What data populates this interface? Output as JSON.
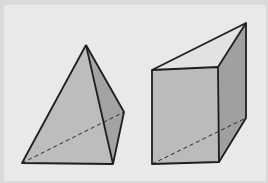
{
  "figure": {
    "background": "#e8e8e8",
    "face_light": "#b9b9b9",
    "face_dark": "#9e9e9e",
    "edge_color": "#1e1e1e",
    "shapes": [
      {
        "name": "tetrahedron",
        "vertices": {
          "apex": [
            86,
            45
          ],
          "right": [
            124,
            112
          ],
          "bottom_left": [
            22,
            163
          ],
          "bottom_right": [
            113,
            164
          ]
        },
        "hidden_edges": [
          [
            "bottom_left",
            "right"
          ]
        ]
      },
      {
        "name": "triangular-prism",
        "vertices": {
          "top_front_left": [
            152,
            70
          ],
          "top_front_right": [
            218,
            67
          ],
          "top_back": [
            246,
            23
          ],
          "bottom_front_left": [
            152,
            164
          ],
          "bottom_front_right": [
            219,
            162
          ],
          "bottom_back": [
            246,
            118
          ]
        },
        "hidden_edges": [
          [
            "bottom_front_left",
            "bottom_back"
          ]
        ]
      }
    ]
  }
}
